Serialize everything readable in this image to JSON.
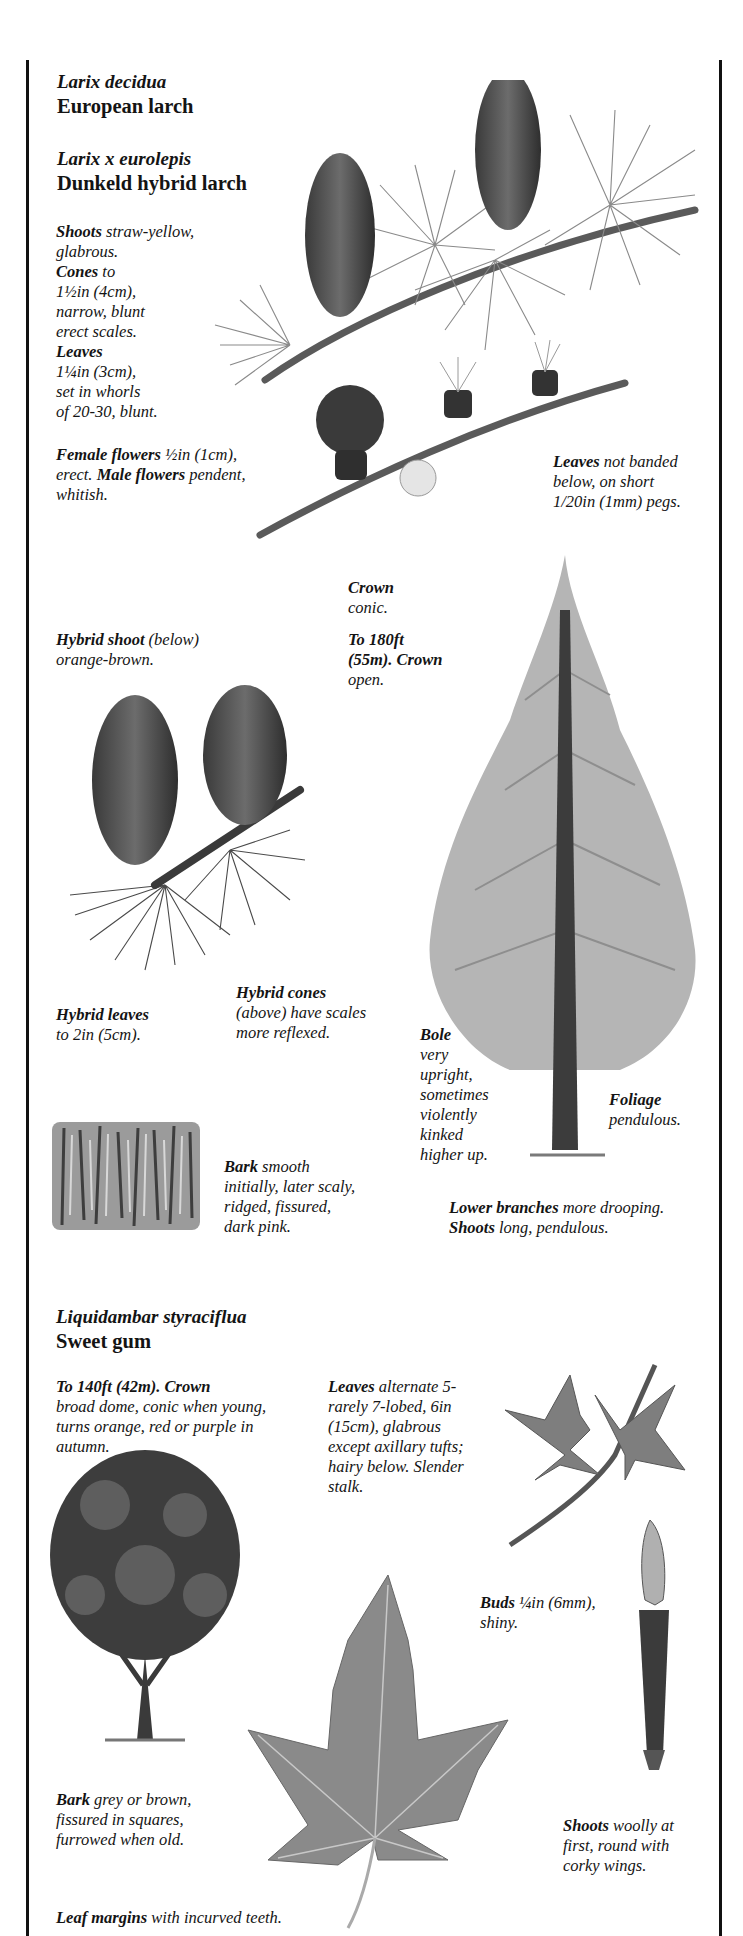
{
  "species": [
    {
      "latin_name": "Larix decidua",
      "common_name": "European larch"
    },
    {
      "latin_name": "Larix x eurolepis",
      "common_name": "Dunkeld hybrid larch"
    },
    {
      "latin_name": "Liquidambar styraciflua",
      "common_name": "Sweet gum"
    }
  ],
  "larch": {
    "shoots": {
      "key": "Shoots",
      "lines": [
        "straw-yellow,",
        "glabrous."
      ]
    },
    "cones": {
      "key": "Cones",
      "lines": [
        "to",
        "1½in (4cm),",
        "narrow, blunt",
        "erect scales."
      ]
    },
    "leaves": {
      "key": "Leaves",
      "lines": [
        "1¼in (3cm),",
        "set in whorls",
        "of 20-30, blunt."
      ]
    },
    "flowers": {
      "key_female": "Female flowers",
      "female_text": "½in (1cm),",
      "line2_prefix": "erect.",
      "key_male": "Male flowers",
      "male_text": "pendent,",
      "line3": "whitish."
    },
    "leaves_note": {
      "key": "Leaves",
      "lines": [
        "not banded",
        "below, on short",
        "1/20in (1mm) pegs."
      ]
    },
    "crown": {
      "key": "Crown",
      "text": "conic."
    },
    "height": {
      "key_lines": [
        "To 180ft",
        "(55m). Crown"
      ],
      "text": "open."
    },
    "hybrid_shoot": {
      "key": "Hybrid shoot",
      "text1": "(below)",
      "text2": "orange-brown."
    },
    "hybrid_leaves": {
      "key": "Hybrid leaves",
      "text": "to 2in (5cm)."
    },
    "hybrid_cones": {
      "key": "Hybrid cones",
      "lines": [
        "(above) have scales",
        "more reflexed."
      ]
    },
    "bole": {
      "key": "Bole",
      "lines": [
        "very",
        "upright,",
        "sometimes",
        "violently",
        "kinked",
        "higher up."
      ]
    },
    "foliage": {
      "key": "Foliage",
      "text": "pendulous."
    },
    "bark": {
      "key": "Bark",
      "first": "smooth",
      "lines": [
        "initially, later scaly,",
        "ridged, fissured,",
        "dark pink."
      ]
    },
    "lower_branches": {
      "key": "Lower branches",
      "text": "more drooping."
    },
    "shoots_long": {
      "key": "Shoots",
      "text": "long, pendulous."
    }
  },
  "sweetgum": {
    "height": {
      "key": "To 140ft (42m). Crown",
      "lines": [
        "broad dome, conic when young,",
        "turns orange, red or purple in",
        "autumn."
      ]
    },
    "leaves": {
      "key": "Leaves",
      "first": "alternate 5-",
      "lines": [
        "rarely 7-lobed, 6in",
        "(15cm), glabrous",
        "except axillary tufts;",
        "hairy below. Slender",
        "stalk."
      ]
    },
    "buds": {
      "key": "Buds",
      "first": "¼in (6mm),",
      "lines": [
        "shiny."
      ]
    },
    "bark": {
      "key": "Bark",
      "first": "grey or brown,",
      "lines": [
        "fissured in squares,",
        "furrowed when old."
      ]
    },
    "shoots": {
      "key": "Shoots",
      "first": "woolly at",
      "lines": [
        "first, round with",
        "corky wings."
      ]
    },
    "leaf_margins": {
      "key": "Leaf margins",
      "text": "with incurved teeth."
    }
  },
  "illustrations": [
    "larch-shoot-with-cones-and-flowers",
    "hybrid-larch-cones",
    "larch-tree",
    "larch-bark",
    "sweet-gum-tree",
    "sweet-gum-leaf-sprig",
    "sweet-gum-bud",
    "sweet-gum-leaf"
  ]
}
